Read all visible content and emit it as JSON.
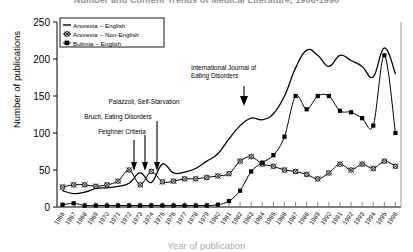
{
  "title": "Number and Content Trends of Medical Literature, 1966-1996",
  "axis": {
    "ylabel": "Number of publications",
    "xlabel": "Year of publication",
    "yticks": [
      "0",
      "50",
      "100",
      "150",
      "200",
      "250"
    ],
    "ylim": [
      0,
      250
    ],
    "xticks": [
      "1966",
      "1967",
      "1968",
      "1969",
      "1970",
      "1971",
      "1972",
      "1973",
      "1974",
      "1975",
      "1976",
      "1977",
      "1978",
      "1979",
      "1980",
      "1981",
      "1982",
      "1983",
      "1984",
      "1985",
      "1986",
      "1987",
      "1988",
      "1989",
      "1990",
      "1991",
      "1992",
      "1993",
      "1994",
      "1995",
      "1996"
    ]
  },
  "legend": {
    "items": [
      {
        "label": "Anorexia -- English",
        "marker": "line"
      },
      {
        "label": "Anorexia -- Non-English",
        "marker": "circle"
      },
      {
        "label": "Bulimia -- English",
        "marker": "square"
      }
    ]
  },
  "annotations": [
    {
      "text": "Palazzoli, Self-Starvation",
      "id": "ann-palazzoli"
    },
    {
      "text": "Bruch, Eating Disorders",
      "id": "ann-bruch"
    },
    {
      "text": "Feighner Criteria",
      "id": "ann-feighner"
    },
    {
      "text": "International Journal of",
      "id": "ann-ijed-line1"
    },
    {
      "text": "Eating Disorders",
      "id": "ann-ijed-line2"
    }
  ],
  "chart_data": {
    "type": "line",
    "title": "Number and Content Trends of Medical Literature, 1966-1996",
    "xlabel": "Year of publication",
    "ylabel": "Number of publications",
    "ylim": [
      0,
      250
    ],
    "grid": false,
    "legend_position": "top-left",
    "categories": [
      "1966",
      "1967",
      "1968",
      "1969",
      "1970",
      "1971",
      "1972",
      "1973",
      "1974",
      "1975",
      "1976",
      "1977",
      "1978",
      "1979",
      "1980",
      "1981",
      "1982",
      "1983",
      "1984",
      "1985",
      "1986",
      "1987",
      "1988",
      "1989",
      "1990",
      "1991",
      "1992",
      "1993",
      "1994",
      "1995",
      "1996"
    ],
    "series": [
      {
        "name": "Anorexia -- English",
        "marker": "none",
        "values": [
          22,
          18,
          20,
          25,
          26,
          28,
          32,
          46,
          33,
          58,
          46,
          47,
          52,
          62,
          72,
          92,
          110,
          120,
          118,
          126,
          150,
          188,
          212,
          205,
          190,
          205,
          198,
          190,
          176,
          215,
          180
        ]
      },
      {
        "name": "Anorexia -- Non-English",
        "marker": "circle",
        "values": [
          27,
          30,
          30,
          28,
          30,
          35,
          50,
          30,
          48,
          34,
          35,
          38,
          38,
          40,
          42,
          45,
          62,
          68,
          58,
          55,
          50,
          48,
          44,
          38,
          46,
          58,
          50,
          58,
          52,
          62,
          55
        ]
      },
      {
        "name": "Bulimia -- English",
        "marker": "square",
        "values": [
          3,
          5,
          2,
          2,
          2,
          2,
          2,
          2,
          2,
          2,
          2,
          2,
          2,
          2,
          3,
          8,
          22,
          48,
          60,
          70,
          95,
          150,
          132,
          150,
          150,
          130,
          128,
          120,
          110,
          205,
          100
        ]
      }
    ]
  }
}
